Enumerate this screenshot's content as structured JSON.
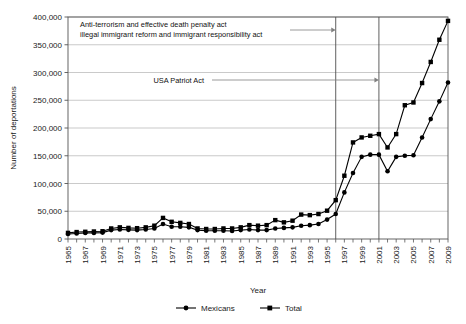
{
  "chart_data": {
    "type": "line",
    "title": "",
    "xlabel": "Year",
    "ylabel": "Number of deportations",
    "xlim": [
      1965,
      2009
    ],
    "ylim": [
      0,
      400000
    ],
    "ytick_step": 50000,
    "grid": true,
    "legend_position": "bottom",
    "x": [
      1965,
      1966,
      1967,
      1968,
      1969,
      1970,
      1971,
      1972,
      1973,
      1974,
      1975,
      1976,
      1977,
      1978,
      1979,
      1980,
      1981,
      1982,
      1983,
      1984,
      1985,
      1986,
      1987,
      1988,
      1989,
      1990,
      1991,
      1992,
      1993,
      1994,
      1995,
      1996,
      1997,
      1998,
      1999,
      2000,
      2001,
      2002,
      2003,
      2004,
      2005,
      2006,
      2007,
      2008,
      2009
    ],
    "series": [
      {
        "name": "Mexicans",
        "marker": "circle",
        "values": [
          9000,
          10000,
          11000,
          11000,
          11500,
          16000,
          17000,
          16500,
          16000,
          17000,
          19000,
          27000,
          22000,
          22000,
          21000,
          16000,
          15000,
          15000,
          15000,
          14500,
          16000,
          17000,
          16000,
          16000,
          19000,
          20000,
          21000,
          24000,
          25000,
          27000,
          35000,
          45000,
          84000,
          119000,
          148000,
          152000,
          152000,
          122000,
          148000,
          150000,
          151000,
          183000,
          216000,
          248000,
          282000
        ]
      },
      {
        "name": "Total",
        "marker": "square",
        "values": [
          11000,
          12500,
          13000,
          13500,
          14000,
          19000,
          21000,
          20000,
          19500,
          21000,
          24000,
          38000,
          31000,
          29000,
          27000,
          19000,
          18000,
          18000,
          19000,
          19000,
          21000,
          25000,
          24000,
          25000,
          34000,
          30000,
          33000,
          44000,
          43000,
          45000,
          51000,
          70000,
          114000,
          174000,
          183000,
          186000,
          189000,
          165000,
          189000,
          241000,
          246000,
          281000,
          319000,
          359000,
          393000
        ]
      }
    ],
    "annotations": [
      {
        "id": "anti-terrorism",
        "line1": "Anti-terrorism and effective death penalty act",
        "line2": "illegal immigrant reform and immigrant responsibility act",
        "arrow_to_year": 1996
      },
      {
        "id": "usa-patriot-act",
        "line1": "USA Patriot Act",
        "line2": "",
        "arrow_to_year": 2001
      }
    ],
    "event_lines": [
      1996,
      2001
    ],
    "colors": {
      "series": "#000000",
      "grid": "#b3b3b3",
      "frame": "#555555",
      "event_line": "#4d4d4d",
      "arrow": "#808080",
      "background": "#ffffff"
    }
  },
  "axes": {
    "y_title": "Number of deportations",
    "x_title": "Year",
    "y_ticks": [
      "0",
      "50,000",
      "100,000",
      "150,000",
      "200,000",
      "250,000",
      "300,000",
      "350,000",
      "400,000"
    ],
    "x_ticks": [
      "1965",
      "1967",
      "1969",
      "1971",
      "1973",
      "1975",
      "1977",
      "1979",
      "1981",
      "1983",
      "1985",
      "1987",
      "1989",
      "1991",
      "1993",
      "1995",
      "1997",
      "1999",
      "2001",
      "2003",
      "2005",
      "2007",
      "2009"
    ]
  },
  "legend": {
    "items": [
      {
        "label": "Mexicans",
        "marker": "circle"
      },
      {
        "label": "Total",
        "marker": "square"
      }
    ]
  }
}
